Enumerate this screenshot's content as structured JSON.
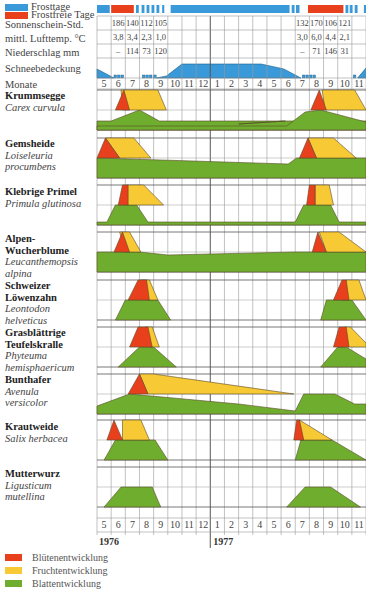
{
  "legend_top": {
    "frost": {
      "label": "Frosttage",
      "color": "#3a9ad9"
    },
    "frostfree": {
      "label": "Frostfreie Tage",
      "color": "#e8401c"
    }
  },
  "rows": {
    "sun": "Sonnenschein-Std.",
    "temp": "mittl. Lufttemp. °C",
    "rain": "Niederschlag mm",
    "snow": "Schneebedeckung",
    "months": "Monate"
  },
  "climate_1976": {
    "sun": [
      "186",
      "140",
      "112",
      "105"
    ],
    "temp": [
      "3,8",
      "3,4",
      "2,3",
      "1,0"
    ],
    "rain": [
      "–",
      "114",
      "73",
      "120"
    ]
  },
  "climate_1977": {
    "sun": [
      "132",
      "170",
      "106",
      "121"
    ],
    "temp": [
      "3,0",
      "6,0",
      "4,4",
      "2,1"
    ],
    "rain": [
      "–",
      "71",
      "146",
      "31"
    ]
  },
  "species": [
    {
      "name": "Krummsegge",
      "latin": "Carex curvula"
    },
    {
      "name": "Gemsheide",
      "latin": "Loiseleuria procumbens"
    },
    {
      "name": "Klebrige Primel",
      "latin": "Primula glutinosa"
    },
    {
      "name": "Alpen-Wucherblume",
      "latin": "Leucanthemopsis alpina"
    },
    {
      "name": "Schweizer Löwenzahn",
      "latin": "Leontodon helveticus"
    },
    {
      "name": "Grasblättrige Teufelskralle",
      "latin": "Phyteuma hemisphaericum"
    },
    {
      "name": "Bunthafer",
      "latin": "Avenula versicolor"
    },
    {
      "name": "Krautweide",
      "latin": "Salix herbacea"
    },
    {
      "name": "Mutterwurz",
      "latin": "Ligusticum mutellina"
    }
  ],
  "years": [
    "1976",
    "1977"
  ],
  "legend_bottom": [
    {
      "label": "Blütenentwicklung",
      "color": "#e8401c"
    },
    {
      "label": "Fruchtentwicklung",
      "color": "#f7c934"
    },
    {
      "label": "Blattentwicklung",
      "color": "#6fad2e"
    }
  ],
  "chart_data": {
    "type": "area",
    "x": [
      "5",
      "6",
      "7",
      "8",
      "9",
      "10",
      "11",
      "12",
      "1",
      "2",
      "3",
      "4",
      "5",
      "6",
      "7",
      "8",
      "9",
      "10",
      "11"
    ],
    "xlabel": "Monate",
    "series_types": [
      "Blütenentwicklung",
      "Fruchtentwicklung",
      "Blattentwicklung"
    ],
    "note": "x in month-column units (0 = start of May 1976); each species panel has bloom/fruit (upper half) and leaf (lower half) profiles",
    "species": [
      {
        "name": "Krummsegge",
        "bloom": [
          [
            1.3,
            1
          ],
          [
            1.9,
            0
          ],
          [
            2.3,
            1
          ]
        ],
        "fruit": [
          [
            1.9,
            0
          ],
          [
            4.3,
            0
          ],
          [
            4.8,
            1
          ],
          [
            2.3,
            1
          ]
        ],
        "leaf": [
          [
            0,
            0.35
          ],
          [
            1,
            0.35
          ],
          [
            3,
            1
          ],
          [
            4.5,
            0.4
          ],
          [
            19,
            0.4
          ]
        ],
        "bloom77": [
          [
            15.3,
            1
          ],
          [
            15.9,
            0
          ],
          [
            16.3,
            1
          ]
        ],
        "fruit77": [
          [
            15.9,
            0
          ],
          [
            18.2,
            0
          ],
          [
            19,
            1
          ],
          [
            16.3,
            1
          ]
        ]
      },
      {
        "name": "Gemsheide",
        "bloom": [
          [
            0,
            1
          ],
          [
            0.6,
            0
          ],
          [
            1.6,
            1
          ]
        ],
        "fruit": [
          [
            0.6,
            0
          ],
          [
            2.5,
            0
          ],
          [
            3.8,
            1
          ],
          [
            1.6,
            1
          ]
        ],
        "leaf": [
          [
            0,
            1
          ],
          [
            19,
            1
          ]
        ],
        "bloom77": [
          [
            14.4,
            1
          ],
          [
            14.9,
            0
          ],
          [
            15.5,
            1
          ]
        ],
        "fruit77": [
          [
            14.9,
            0
          ],
          [
            16.8,
            0
          ],
          [
            18.5,
            1
          ],
          [
            15.5,
            1
          ]
        ]
      },
      {
        "name": "Klebrige Primel",
        "bloom": [
          [
            1.4,
            1
          ],
          [
            1.6,
            0
          ],
          [
            2.1,
            0
          ],
          [
            2.1,
            1
          ]
        ],
        "fruit": [
          [
            2.1,
            0
          ],
          [
            3.5,
            0
          ],
          [
            4.6,
            1
          ],
          [
            2.1,
            1
          ]
        ],
        "leaf": [
          [
            0,
            0.15
          ],
          [
            0.7,
            0.15
          ],
          [
            1.2,
            1
          ],
          [
            2.8,
            1
          ],
          [
            4.5,
            0.15
          ],
          [
            19,
            0.15
          ]
        ]
      }
    ]
  }
}
